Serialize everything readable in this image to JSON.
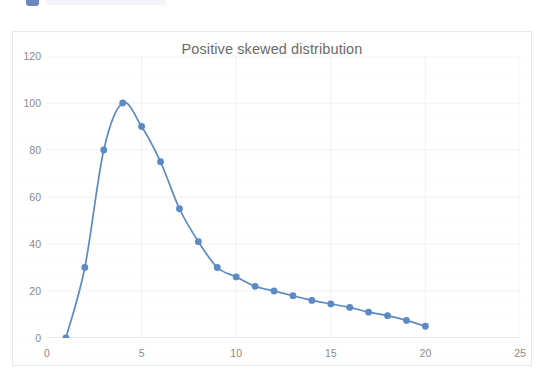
{
  "chart_data": {
    "type": "line",
    "title": "Positive skewed distribution",
    "xlabel": "",
    "ylabel": "",
    "xlim": [
      0,
      25
    ],
    "ylim": [
      0,
      120
    ],
    "grid": true,
    "legend": false,
    "x_ticks": [
      0,
      5,
      10,
      15,
      20,
      25
    ],
    "y_ticks": [
      0,
      20,
      40,
      60,
      80,
      100,
      120
    ],
    "markers": true,
    "series": [
      {
        "name": "Positive skewed distribution",
        "color": "#5b8ac5",
        "x": [
          1,
          2,
          3,
          4,
          5,
          6,
          7,
          8,
          9,
          10,
          11,
          12,
          13,
          14,
          15,
          16,
          17,
          18,
          19,
          20
        ],
        "values": [
          0,
          30,
          80,
          100,
          90,
          75,
          55,
          41,
          30,
          26,
          22,
          20,
          18,
          16,
          14.5,
          13,
          11,
          9.5,
          7.5,
          5
        ]
      }
    ]
  },
  "chart": {
    "title": "Positive skewed distribution",
    "line_color": "#5b8ac5",
    "marker_color": "#5b8ac5",
    "axis_color": "#d9d9d9",
    "grid_color": "#f1f2f4",
    "tick_label_color": "#8a8a8a",
    "title_color": "#6b6b6b",
    "border_color": "#e4e7ec",
    "background": "#ffffff"
  }
}
